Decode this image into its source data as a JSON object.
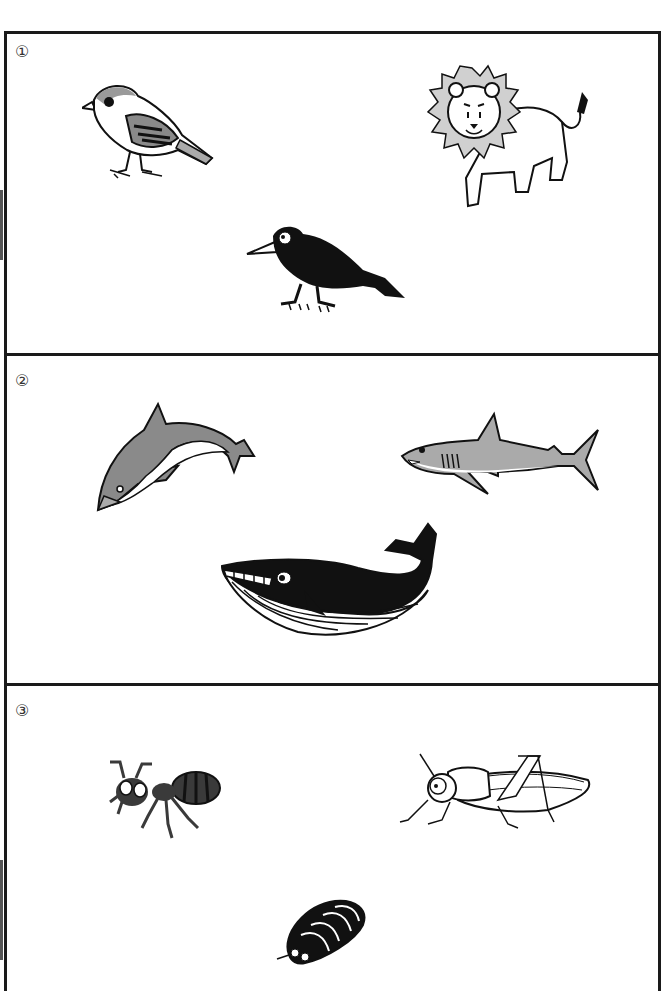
{
  "worksheet": {
    "sections": [
      {
        "number": "①",
        "animals": [
          {
            "name": "sparrow",
            "label": "sparrow"
          },
          {
            "name": "lion",
            "label": "lion"
          },
          {
            "name": "crow",
            "label": "crow"
          }
        ]
      },
      {
        "number": "②",
        "animals": [
          {
            "name": "dolphin",
            "label": "dolphin"
          },
          {
            "name": "shark",
            "label": "shark"
          },
          {
            "name": "whale",
            "label": "whale"
          }
        ]
      },
      {
        "number": "③",
        "animals": [
          {
            "name": "ant",
            "label": "ant"
          },
          {
            "name": "grasshopper",
            "label": "grasshopper"
          },
          {
            "name": "pill-bug",
            "label": "pill bug"
          }
        ]
      }
    ],
    "colors": {
      "border": "#1a1a1a",
      "gray_fill": "#8a8a8a",
      "light_gray": "#d0d0d0",
      "black_fill": "#111111"
    }
  }
}
